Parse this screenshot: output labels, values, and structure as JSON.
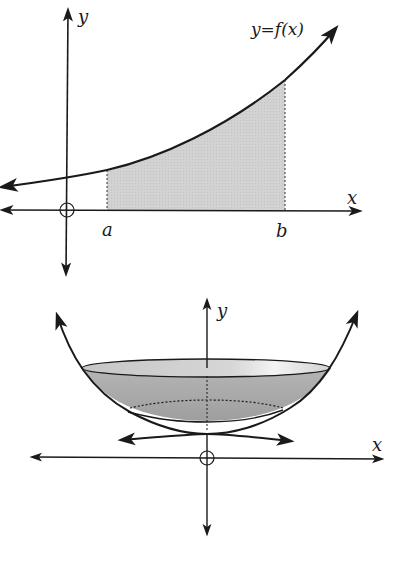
{
  "figure_top": {
    "title": "Area under y=f(x) from a to b",
    "axis_x_label": "x",
    "axis_y_label": "y",
    "curve_label": "y=f(x)",
    "bound_a_label": "a",
    "bound_b_label": "b",
    "origin_marker": "circle-cross",
    "shade_color": "#d4d4d4",
    "line_color": "#1a1a1a"
  },
  "figure_bottom": {
    "title": "Solid of revolution about the y-axis (bowl)",
    "axis_x_label": "x",
    "axis_y_label": "y",
    "origin_marker": "circle-cross",
    "bowl_fill_color": "#a8a8a8",
    "bowl_top_color": "#cfcfcf",
    "line_color": "#1a1a1a"
  }
}
